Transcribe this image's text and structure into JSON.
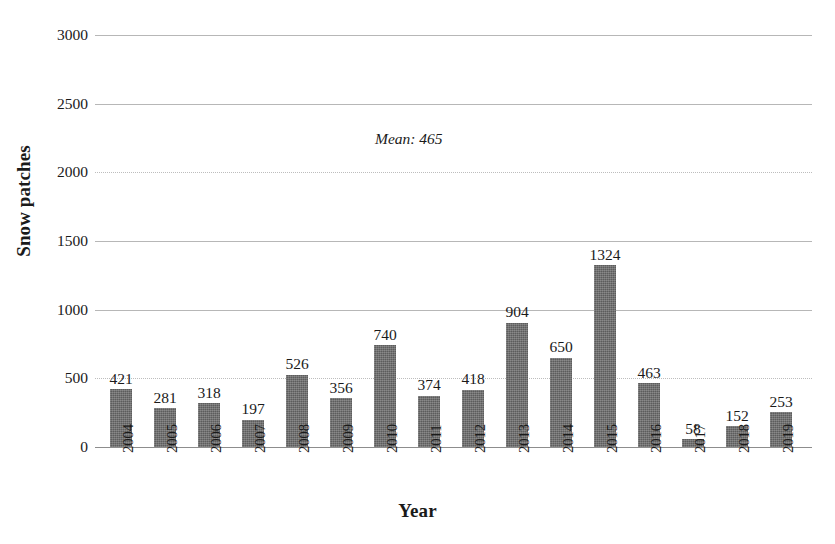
{
  "chart_data": {
    "type": "bar",
    "title": "",
    "xlabel": "Year",
    "ylabel": "Snow patches",
    "categories": [
      "2004",
      "2005",
      "2006",
      "2007",
      "2008",
      "2009",
      "2010",
      "2011",
      "2012",
      "2013",
      "2014",
      "2015",
      "2016",
      "2017",
      "2018",
      "2019"
    ],
    "values": [
      421,
      281,
      318,
      197,
      526,
      356,
      740,
      374,
      418,
      904,
      650,
      1324,
      463,
      58,
      152,
      253
    ],
    "data_labels": [
      "421",
      "281",
      "318",
      "197",
      "526",
      "356",
      "740",
      "374",
      "418",
      "904",
      "650",
      "1324",
      "463",
      "58",
      "152",
      "253"
    ],
    "ylim": [
      0,
      3000
    ],
    "ytick_values": [
      0,
      500,
      1000,
      1500,
      2000,
      2500,
      3000
    ],
    "ytick_labels": [
      "0",
      "500",
      "1000",
      "1500",
      "2000",
      "2500",
      "3000"
    ],
    "grid": true,
    "legend": false,
    "annotations": [
      {
        "name": "mean-annotation",
        "text": "Mean: 465",
        "value": 465
      }
    ],
    "bar_color": "#5c5c5c",
    "gridline_color": "#b7b7b7",
    "background_color": "#ffffff"
  },
  "caption": {
    "text": ""
  }
}
